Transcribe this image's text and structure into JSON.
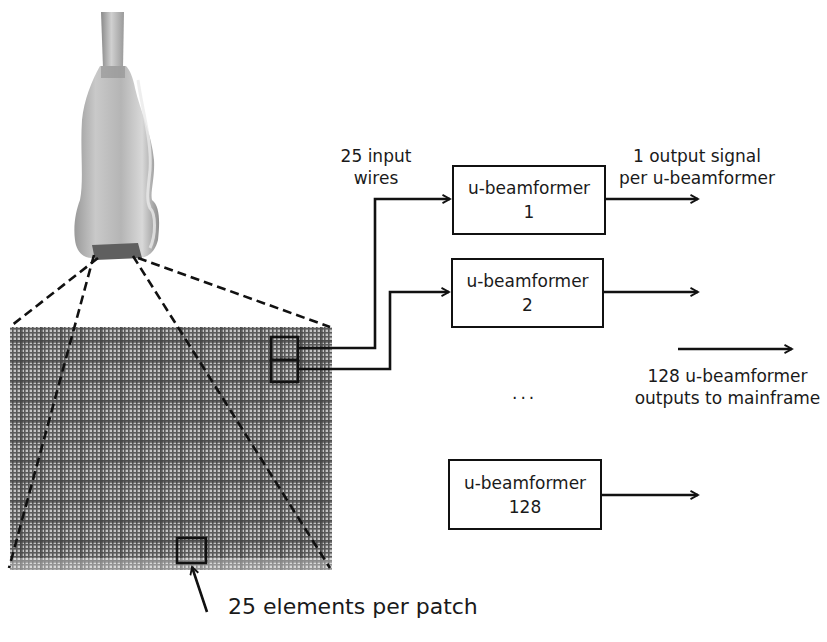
{
  "diagram": {
    "probe_icon": "ultrasound-probe",
    "array_icon": "transducer-element-grid",
    "labels": {
      "input_wires": [
        "25 input",
        "wires"
      ],
      "output_signal": [
        "1 output signal",
        "per u-beamformer"
      ],
      "mainframe_outputs": [
        "128 u-beamformer",
        "outputs to mainframe"
      ],
      "ellipsis": "...",
      "patch_caption": "25 elements per patch"
    },
    "beamformers": [
      {
        "name": "u-beamformer",
        "index": "1"
      },
      {
        "name": "u-beamformer",
        "index": "2"
      },
      {
        "name": "u-beamformer",
        "index": "128"
      }
    ],
    "colors": {
      "line": "#111111",
      "grid_bg": "#8a8a8a",
      "grid_line": "#4a4a4a",
      "probe_body": "#b8b8b8"
    }
  }
}
